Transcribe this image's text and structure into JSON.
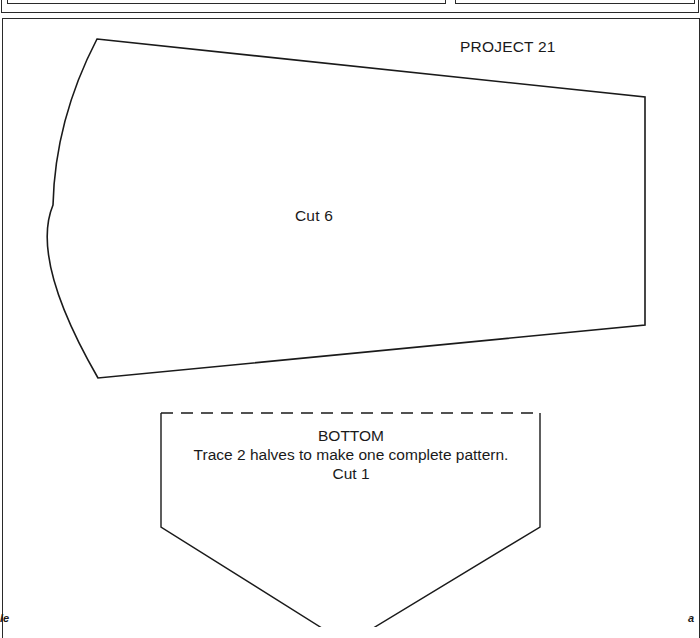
{
  "page": {
    "title": "PROJECT 21",
    "pieces": [
      {
        "name": "side-panel",
        "instruction": "Cut 6",
        "outline": "solid"
      },
      {
        "name": "bottom",
        "label": "BOTTOM",
        "instruction": "Trace 2 halves to make one complete pattern.",
        "cut": "Cut 1",
        "fold_line": "dashed"
      }
    ],
    "corner_marks": {
      "left": "le",
      "right": "a"
    },
    "colors": {
      "ink": "#1a1a1a",
      "paper": "#ffffff"
    }
  }
}
